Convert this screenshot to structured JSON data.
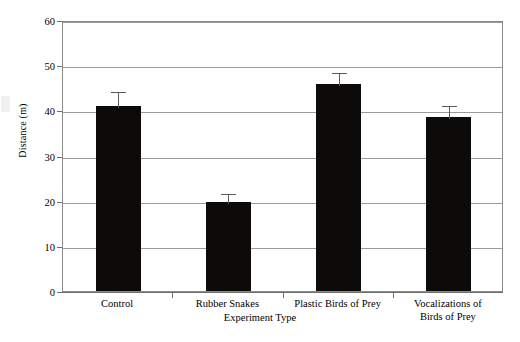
{
  "chart_data": {
    "type": "bar",
    "title": "",
    "xlabel": "Experiment Type",
    "ylabel": "Distance (m)",
    "categories": [
      "Control",
      "Rubber Snakes",
      "Plastic Birds of Prey",
      "Vocalizations of\nBirds of Prey"
    ],
    "values": [
      41.0,
      19.7,
      45.8,
      38.6
    ],
    "errors_upper": [
      44.5,
      22.0,
      48.7,
      41.5
    ],
    "error_bars": [
      3.5,
      2.3,
      2.9,
      2.9
    ],
    "ylim": [
      0,
      60
    ],
    "ytick_labels": [
      "0",
      "10",
      "20",
      "30",
      "40",
      "50",
      "60"
    ],
    "ytick_values": [
      0,
      10,
      20,
      30,
      40,
      50,
      60
    ],
    "grid": "horizontal",
    "legend": "none",
    "bar_color": "#0d0b09",
    "gridline_color": "#9a9a9a",
    "axis_color": "#6f6f6f",
    "background_color": "#ffffff"
  }
}
